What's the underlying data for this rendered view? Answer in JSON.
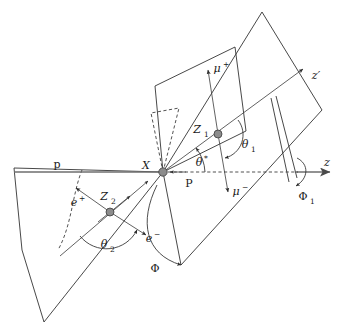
{
  "figure": {
    "type": "physics-decay-angle-diagram",
    "background_color": "#ffffff",
    "line_color": "#333333",
    "axis_color": "#6e6e6e",
    "vertex_color": "#8c8c8c"
  },
  "labels": {
    "proton_left": "p",
    "resonance": "X",
    "production_momentum": "P",
    "axis_z": "z",
    "axis_z_prime": "z′",
    "boson_1": "Z",
    "boson_1_sub": "1",
    "boson_2": "Z",
    "boson_2_sub": "2",
    "muon_plus": "μ",
    "muon_plus_sup": "+",
    "muon_minus": "μ",
    "muon_minus_sup": "−",
    "electron_plus": "e",
    "electron_plus_sup": "+",
    "electron_minus": "e",
    "electron_minus_sup": "−",
    "theta_star": "θ",
    "theta_star_sup": "*",
    "theta_1": "θ",
    "theta_1_sub": "1",
    "theta_2": "θ",
    "theta_2_sub": "2",
    "phi": "Φ",
    "phi_1": "Φ",
    "phi_1_sub": "1"
  }
}
